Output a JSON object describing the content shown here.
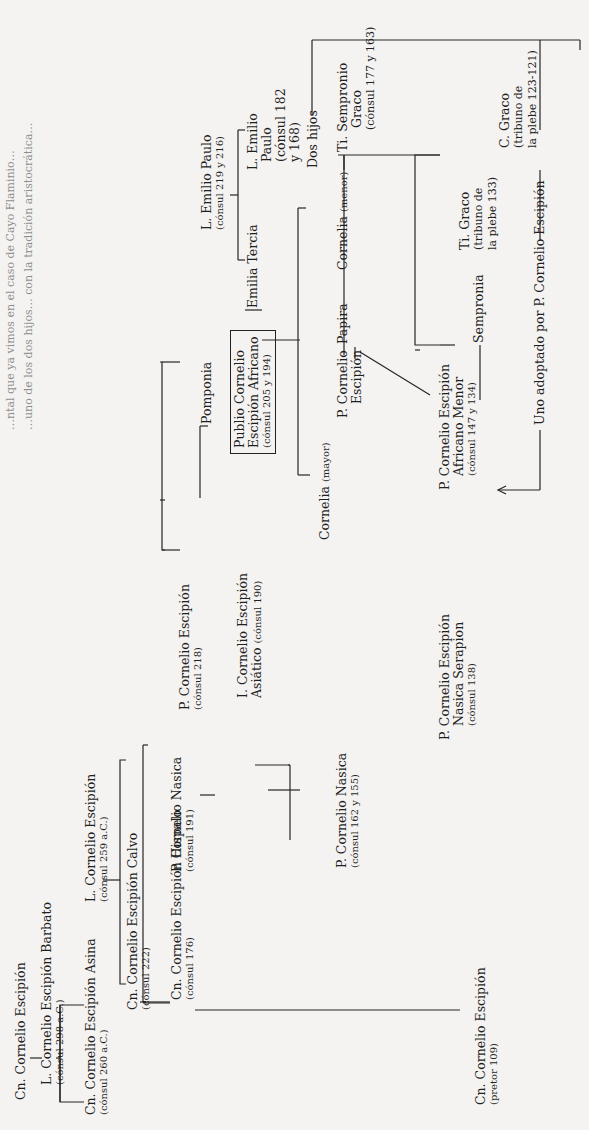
{
  "page": {
    "top_text_fragments": [
      "…ntal que ya vimos en el caso de Cayo Flaminio…",
      "…uno de los dos hijos… con la tradición aristocrática…"
    ]
  },
  "tree": {
    "root": {
      "name": "Cn. Cornelio Escipión"
    },
    "barbato": {
      "name": "L. Cornelio Escipión Barbato",
      "sub": "(cónsul 298 a.C.)"
    },
    "asina": {
      "name": "Cn. Cornelio Escipión Asina",
      "sub": "(cónsul 260 a.C.)"
    },
    "l259": {
      "name": "L. Cornelio Escipión",
      "sub": "(cónsul 259 a.C.)"
    },
    "calvo": {
      "name": "Cn. Cornelio Escipión Calvo",
      "sub": "(cónsul 222)"
    },
    "p218": {
      "name": "P. Cornelio Escipión",
      "sub": "(cónsul 218)"
    },
    "hispalo": {
      "name": "Cn. Cornelio Escipión Hispalo",
      "sub": "(cónsul 176)"
    },
    "nasica191": {
      "name": "P. Cornelio Nasica",
      "sub": "(cónsul 191)"
    },
    "asiatico": {
      "name": "I. Cornelio Escipión",
      "name2": "Asiático",
      "sub": "(cónsul 190)"
    },
    "pomponia": {
      "name": "Pomponia"
    },
    "africano": {
      "line1": "Publio Cornelio",
      "line2": "Escipión Africano",
      "sub": "(cónsul 205 y 194)"
    },
    "emilio_paulo": {
      "name": "L. Emilio Paulo",
      "sub": "(cónsul 219 y 216)"
    },
    "emilia_tercia": {
      "name": "Emilia Tercia"
    },
    "emilio_paulo2": {
      "line1": "L. Emilio",
      "line2": "Paulo",
      "line3": "(cónsul 182",
      "line4": "y 168)"
    },
    "dos_hijos": {
      "name": "Dos hijos"
    },
    "nasica162": {
      "name": "P. Cornelio Nasica",
      "sub": "(cónsul 162 y 155)"
    },
    "cornelia_mayor": {
      "name": "Cornelia",
      "qual": "(mayor)"
    },
    "p_cornelio_escipion": {
      "line1": "P. Cornelio",
      "line2": "Escipión"
    },
    "papira": {
      "name": "Papira"
    },
    "cornelia_menor": {
      "name": "Cornelia",
      "qual": "(menor)"
    },
    "ti_sempronio": {
      "line1": "Ti. Sempronio",
      "line2": "Graco",
      "sub": "(cónsul 177 y 163)"
    },
    "serapion": {
      "line1": "P. Cornelio Escipión",
      "line2": "Nasica Serapion",
      "sub": "(cónsul 138)"
    },
    "africano_menor": {
      "line1": "P. Cornelio Escipión",
      "line2": "Africano Menor",
      "sub": "(cónsul 147 y 134)"
    },
    "sempronia": {
      "name": "Sempronia"
    },
    "ti_graco": {
      "line1": "Ti. Graco",
      "line2": "(tribuno de",
      "line3": "la plebe 133)"
    },
    "c_graco": {
      "line1": "C. Graco",
      "line2": "(tribuno de",
      "line3": "la plebe 123-121)"
    },
    "adoptado": {
      "name": "Uno adoptado por P. Cornelio Escipión"
    },
    "pretor109": {
      "name": "Cn. Cornelio Escipión",
      "sub": "(pretor 109)"
    }
  }
}
